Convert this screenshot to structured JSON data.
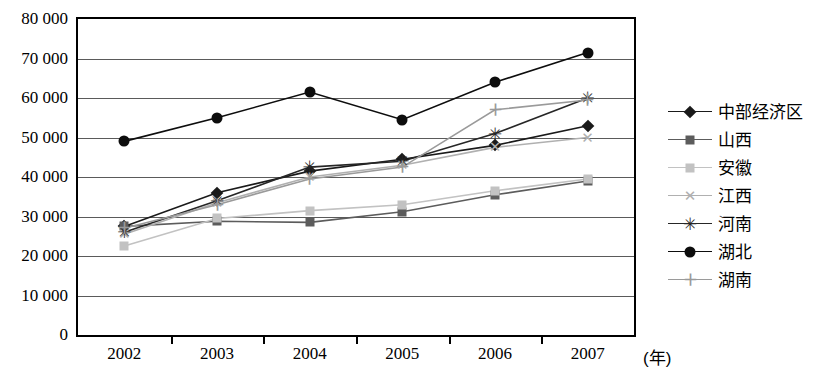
{
  "chart_data": {
    "type": "line",
    "title": "",
    "xlabel": "(年)",
    "ylabel": "",
    "categories": [
      "2002",
      "2003",
      "2004",
      "2005",
      "2006",
      "2007"
    ],
    "ylim": [
      0,
      80000
    ],
    "ytick_labels": [
      "80 000",
      "70 000",
      "60 000",
      "50 000",
      "40 000",
      "30 000",
      "20 000",
      "10 000",
      "0"
    ],
    "ytick_values": [
      80000,
      70000,
      60000,
      50000,
      40000,
      30000,
      20000,
      10000,
      0
    ],
    "ytick_step": 10000,
    "grid": true,
    "legend_position": "right",
    "series": [
      {
        "name": "中部经济区",
        "marker": "diamond",
        "color": "#1a1a1a",
        "values": [
          27500,
          36000,
          41500,
          44500,
          48000,
          53000
        ]
      },
      {
        "name": "山西",
        "marker": "square",
        "color": "#5c5c5c",
        "values": [
          27500,
          28800,
          28500,
          31200,
          35500,
          39000
        ]
      },
      {
        "name": "安徽",
        "marker": "square",
        "color": "#c2c2c2",
        "values": [
          22500,
          29500,
          31500,
          33000,
          36500,
          39500
        ]
      },
      {
        "name": "江西",
        "marker": "x",
        "color": "#b0b0b0",
        "values": [
          25500,
          33500,
          40000,
          43000,
          47500,
          50000
        ]
      },
      {
        "name": "河南",
        "marker": "star",
        "color": "#262626",
        "values": [
          26000,
          34000,
          42500,
          44000,
          51000,
          60000
        ]
      },
      {
        "name": "湖北",
        "marker": "circle",
        "color": "#0d0d0d",
        "values": [
          49000,
          55000,
          61500,
          54500,
          64000,
          71500
        ]
      },
      {
        "name": "湖南",
        "marker": "plus",
        "color": "#9a9a9a",
        "values": [
          27000,
          33000,
          39500,
          42500,
          57000,
          59500
        ]
      }
    ]
  }
}
